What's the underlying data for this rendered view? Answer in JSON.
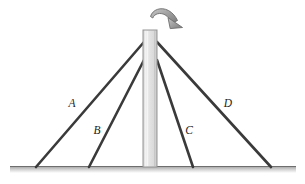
{
  "figure": {
    "background_color": "#ffffff",
    "canvas": {
      "width": 305,
      "height": 184
    }
  },
  "ground": {
    "name": "ground-line",
    "x_start": 10,
    "x_end": 296,
    "y_top": 166,
    "thickness": 7,
    "color_top": "#8c8c8c",
    "color_bottom": "#ffffff"
  },
  "pole": {
    "name": "vertical-pole",
    "x_left": 143,
    "x_right": 157,
    "y_top": 30,
    "y_bottom": 167,
    "fill_light": "#efefef",
    "fill_mid": "#d8d8d8",
    "outline_color": "#8f8f8f"
  },
  "rotation_arrow": {
    "name": "rotation-arrow",
    "direction": "clockwise",
    "fill": "#9a9a9a",
    "outline": "#6a6a6a",
    "start": {
      "x": 152,
      "y": 12
    },
    "end": {
      "x": 175,
      "y": 27
    }
  },
  "wires": [
    {
      "id": "A",
      "label": "A",
      "label_x": 72,
      "label_y": 104,
      "top": {
        "x": 144,
        "y": 42
      },
      "base": {
        "x": 36,
        "y": 167
      },
      "color": "#3a3a3a",
      "width": 2.6
    },
    {
      "id": "B",
      "label": "B",
      "label_x": 97,
      "label_y": 131,
      "top": {
        "x": 144,
        "y": 60
      },
      "base": {
        "x": 89,
        "y": 167
      },
      "color": "#3a3a3a",
      "width": 2.6
    },
    {
      "id": "C",
      "label": "C",
      "label_x": 189,
      "label_y": 131,
      "top": {
        "x": 157,
        "y": 60
      },
      "base": {
        "x": 193,
        "y": 167
      },
      "color": "#3a3a3a",
      "width": 2.6
    },
    {
      "id": "D",
      "label": "D",
      "label_x": 228,
      "label_y": 104,
      "top": {
        "x": 157,
        "y": 42
      },
      "base": {
        "x": 271,
        "y": 167
      },
      "color": "#3a3a3a",
      "width": 2.6
    }
  ]
}
